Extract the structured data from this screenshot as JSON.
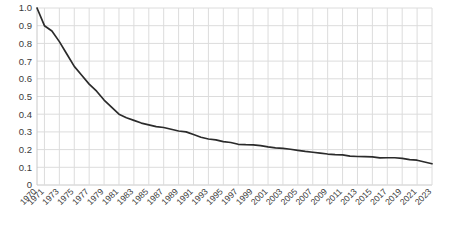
{
  "chart_data": {
    "type": "line",
    "title": "",
    "subtitle": "",
    "xlabel": "",
    "ylabel": "",
    "grid": true,
    "legend": null,
    "legend_position": "none",
    "line_color": "#2b2b2b",
    "grid_color": "#dcdcdc",
    "axis_color": "#c8c8c8",
    "background_color": "#ffffff",
    "ylim": [
      0,
      1.0
    ],
    "ytick_labels": [
      "1.0",
      "0.9",
      "0.8",
      "0.7",
      "0.6",
      "0.5",
      "0.4",
      "0.3",
      "0.2",
      "0.1",
      "0"
    ],
    "ytick_values": [
      1.0,
      0.9,
      0.8,
      0.7,
      0.6,
      0.5,
      0.4,
      0.3,
      0.2,
      0.1,
      0
    ],
    "xtick_labels": [
      "1970",
      "1971",
      "1973",
      "1975",
      "1977",
      "1979",
      "1981",
      "1983",
      "1985",
      "1987",
      "1989",
      "1991",
      "1993",
      "1995",
      "1997",
      "1999",
      "2001",
      "2003",
      "2005",
      "2007",
      "2009",
      "2011",
      "2013",
      "2015",
      "2017",
      "2019",
      "2021",
      "2023"
    ],
    "xtick_rotation_degrees": 45,
    "x": [
      1970,
      1971,
      1972,
      1973,
      1974,
      1975,
      1976,
      1977,
      1978,
      1979,
      1980,
      1981,
      1982,
      1983,
      1984,
      1985,
      1986,
      1987,
      1988,
      1989,
      1990,
      1991,
      1992,
      1993,
      1994,
      1995,
      1996,
      1997,
      1998,
      1999,
      2000,
      2001,
      2002,
      2003,
      2004,
      2005,
      2006,
      2007,
      2008,
      2009,
      2010,
      2011,
      2012,
      2013,
      2014,
      2015,
      2016,
      2017,
      2018,
      2019,
      2020,
      2021,
      2022,
      2023
    ],
    "values": [
      1.0,
      0.9,
      0.87,
      0.81,
      0.74,
      0.67,
      0.62,
      0.57,
      0.53,
      0.48,
      0.44,
      0.4,
      0.38,
      0.365,
      0.35,
      0.34,
      0.33,
      0.325,
      0.315,
      0.305,
      0.3,
      0.285,
      0.27,
      0.26,
      0.255,
      0.245,
      0.24,
      0.23,
      0.228,
      0.227,
      0.222,
      0.215,
      0.21,
      0.207,
      0.202,
      0.196,
      0.19,
      0.185,
      0.18,
      0.175,
      0.172,
      0.17,
      0.163,
      0.161,
      0.16,
      0.159,
      0.153,
      0.154,
      0.154,
      0.15,
      0.143,
      0.14,
      0.13,
      0.12
    ],
    "series": [
      {
        "name": "series-1",
        "values": [
          1.0,
          0.9,
          0.87,
          0.81,
          0.74,
          0.67,
          0.62,
          0.57,
          0.53,
          0.48,
          0.44,
          0.4,
          0.38,
          0.365,
          0.35,
          0.34,
          0.33,
          0.325,
          0.315,
          0.305,
          0.3,
          0.285,
          0.27,
          0.26,
          0.255,
          0.245,
          0.24,
          0.23,
          0.228,
          0.227,
          0.222,
          0.215,
          0.21,
          0.207,
          0.202,
          0.196,
          0.19,
          0.185,
          0.18,
          0.175,
          0.172,
          0.17,
          0.163,
          0.161,
          0.16,
          0.159,
          0.153,
          0.154,
          0.154,
          0.15,
          0.143,
          0.14,
          0.13,
          0.12
        ]
      }
    ]
  },
  "plot_geometry": {
    "left": 37,
    "right": 432,
    "top": 8,
    "bottom": 185
  }
}
